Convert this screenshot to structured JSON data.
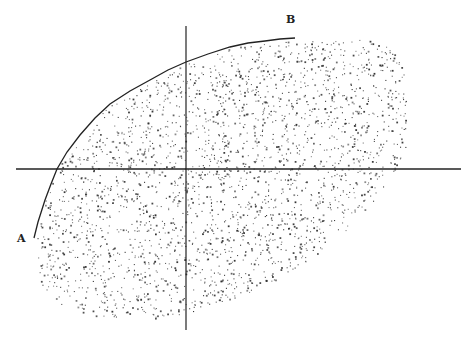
{
  "diagram": {
    "colors": {
      "background": "#ffffff",
      "ink": "#222222",
      "dots": "#333333"
    },
    "labels": {
      "A": {
        "text": "A",
        "x": 17,
        "y": 242
      },
      "B": {
        "text": "B",
        "x": 286,
        "y": 23
      }
    },
    "axes": {
      "horizontal": {
        "x1": 16,
        "y1": 169,
        "x2": 461,
        "y2": 169,
        "width": 1.6
      },
      "vertical": {
        "x1": 186,
        "y1": 26,
        "x2": 186,
        "y2": 330,
        "width": 1.2
      }
    },
    "curve_AB": {
      "points": [
        [
          34,
          238
        ],
        [
          38,
          222
        ],
        [
          45,
          200
        ],
        [
          51,
          184
        ],
        [
          57,
          169
        ],
        [
          67,
          152
        ],
        [
          80,
          135
        ],
        [
          95,
          118
        ],
        [
          110,
          104
        ],
        [
          130,
          91
        ],
        [
          150,
          80
        ],
        [
          168,
          70
        ],
        [
          186,
          62
        ],
        [
          208,
          54
        ],
        [
          230,
          47
        ],
        [
          248,
          43
        ],
        [
          265,
          41
        ],
        [
          280,
          39
        ],
        [
          295,
          38
        ]
      ],
      "width": 1.3
    },
    "scatter": {
      "count": 2600,
      "seed": 7,
      "dot_size": 1.1,
      "region_note": "dots fill area right/below the A–B curve, tilted elliptical cloud",
      "ellipse": {
        "cx": 215,
        "cy": 170,
        "rx": 215,
        "ry": 125,
        "rotation_deg": -28
      },
      "bottom_limit": 318,
      "right_limit": 406
    }
  }
}
